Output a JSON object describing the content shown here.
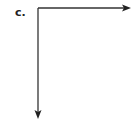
{
  "figure": {
    "label": "c.",
    "origin": {
      "x": 38,
      "y": 8
    },
    "arrows": [
      {
        "name": "horizontal-axis-arrow",
        "direction": "right",
        "end": {
          "x": 131,
          "y": 8
        }
      },
      {
        "name": "vertical-axis-arrow",
        "direction": "down",
        "end": {
          "x": 38,
          "y": 119
        }
      }
    ],
    "stroke_color": "#333333"
  }
}
